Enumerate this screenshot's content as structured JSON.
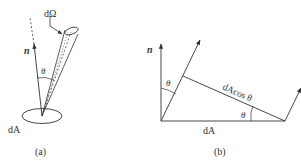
{
  "figure_a": {
    "normal_label": "n",
    "solid_angle_label": "dΩ",
    "angle_label": "θ",
    "area_label": "dA",
    "caption": "(a)"
  },
  "figure_b": {
    "normal_label": "n",
    "angle_label_top": "θ",
    "projected_label": "dAcos θ",
    "angle_label_bottom": "θ",
    "area_label": "dA",
    "caption": "(b)"
  },
  "colors": {
    "line": "#333333",
    "background": "#ffffff"
  }
}
